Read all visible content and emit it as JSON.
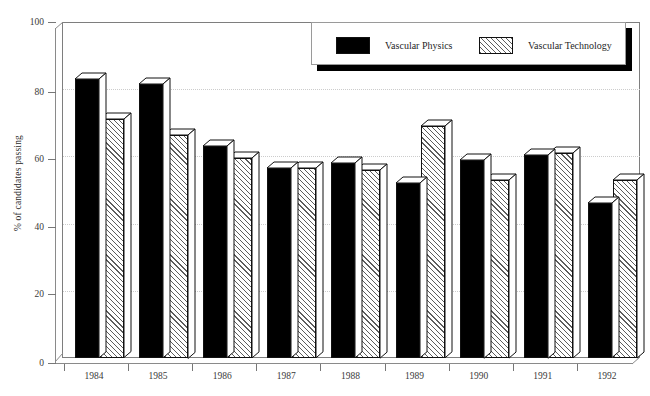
{
  "chart_data": {
    "type": "bar",
    "title": "",
    "subtitle": "",
    "xlabel": "",
    "ylabel": "% of candidates passing",
    "categories": [
      "1984",
      "1985",
      "1986",
      "1987",
      "1988",
      "1989",
      "1990",
      "1991",
      "1992"
    ],
    "series": [
      {
        "name": "Vascular Physics",
        "fill": "solid-black",
        "color": "#000000",
        "values": [
          83,
          81.5,
          63,
          56.5,
          58,
          52,
          59,
          60.5,
          46
        ]
      },
      {
        "name": "Vascular Technology",
        "fill": "diagonal-hatch",
        "color": "#ffffff",
        "values": [
          71,
          66.5,
          59.5,
          56.5,
          56,
          69,
          53,
          61,
          53
        ]
      }
    ],
    "ylim": [
      0,
      100
    ],
    "yticks": [
      0,
      20,
      40,
      60,
      80,
      100
    ],
    "ytick_labels": [
      "0",
      "20",
      "40",
      "60",
      "80",
      "100"
    ],
    "grid": true,
    "grid_axis": "y",
    "legend_position": "top-right",
    "style": "3d-bars-with-shadowed-legend"
  },
  "legend": {
    "entries": [
      {
        "label": "Vascular Physics",
        "swatch": "solid"
      },
      {
        "label": "Vascular Technology",
        "swatch": "hatch"
      }
    ]
  }
}
